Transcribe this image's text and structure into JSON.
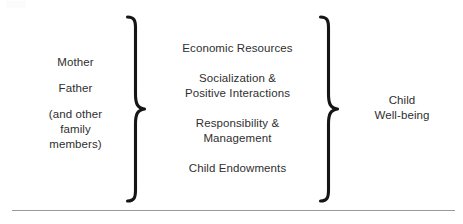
{
  "diagram": {
    "type": "conceptual-model",
    "title": "",
    "background_color": "#ffffff",
    "text_color": "#2f2f2f",
    "brace_color": "#151515",
    "rule_color": "#9a9a9a",
    "inputs": {
      "label": "parents",
      "lines": [
        "Mother",
        "Father",
        "(and other",
        "family",
        "members)"
      ]
    },
    "mediators": {
      "label": "parental investments",
      "items": [
        {
          "line1": "Economic Resources",
          "line2": ""
        },
        {
          "line1": "Socialization &",
          "line2": "Positive Interactions"
        },
        {
          "line1": "Responsibility &",
          "line2": "Management"
        },
        {
          "line1": "Child Endowments",
          "line2": ""
        }
      ]
    },
    "outcome": {
      "label": "outcome",
      "lines": [
        "Child",
        "Well-being"
      ]
    },
    "braces": [
      {
        "name": "left-brace",
        "glyph": "}",
        "direction": "right"
      },
      {
        "name": "right-brace",
        "glyph": "}",
        "direction": "right"
      }
    ]
  }
}
